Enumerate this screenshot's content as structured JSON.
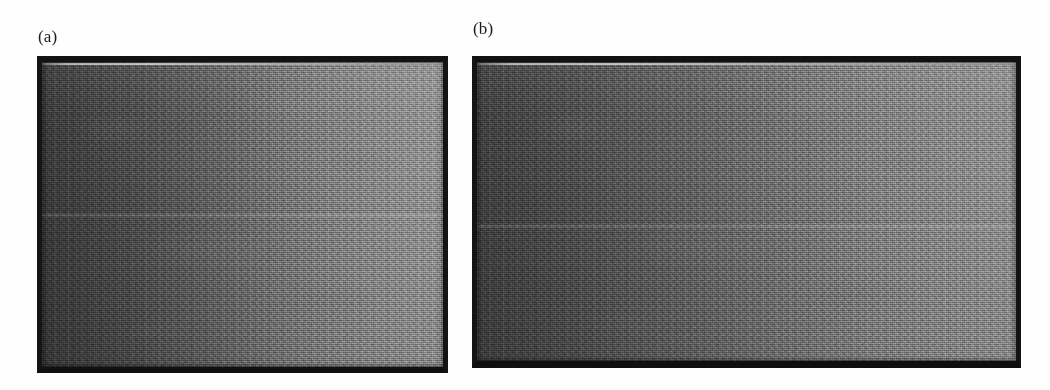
{
  "figure": {
    "caption_labels": {
      "panel_a": "(a)",
      "panel_b": "(b)"
    },
    "panels": [
      {
        "id": "panel-a",
        "label": "(a)",
        "kind": "grayscale-micrograph",
        "border_color": "#121212",
        "gradient": {
          "direction": "left-to-right",
          "dark_end": "#3a3a3a",
          "light_end": "#929292"
        },
        "features": [
          "bright-highlight-line-below-top-border",
          "faint-horizontal-seam-near-middle",
          "film-grain-texture",
          "vertical-striations"
        ]
      },
      {
        "id": "panel-b",
        "label": "(b)",
        "kind": "grayscale-micrograph",
        "border_color": "#111111",
        "gradient": {
          "direction": "left-to-right",
          "dark_end": "#3f3f3f",
          "light_end": "#8f8f8f"
        },
        "features": [
          "bright-highlight-line-below-top-border",
          "faint-horizontal-seam-near-middle",
          "film-grain-texture",
          "vertical-striations"
        ]
      }
    ],
    "background_color": "#ffffff"
  }
}
